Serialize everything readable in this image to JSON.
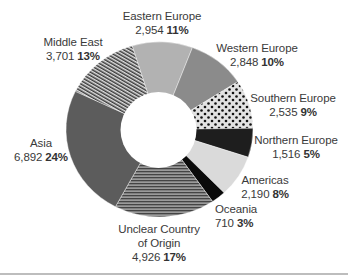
{
  "chart_data": {
    "type": "pie",
    "subtype": "donut",
    "title": "",
    "total": 28272,
    "start_angle_deg": -17,
    "direction": "clockwise",
    "slices": [
      {
        "label": "Eastern Europe",
        "value": 2954,
        "value_text": "2,954",
        "percent": "11%",
        "fill": "solid",
        "color": "#b2b2b2"
      },
      {
        "label": "Western Europe",
        "value": 2848,
        "value_text": "2,848",
        "percent": "10%",
        "fill": "solid",
        "color": "#8b8b8b"
      },
      {
        "label": "Southern Europe",
        "value": 2535,
        "value_text": "2,535",
        "percent": "9%",
        "fill": "dots",
        "color": "#dedede"
      },
      {
        "label": "Northern Europe",
        "value": 1516,
        "value_text": "1,516",
        "percent": "5%",
        "fill": "solid",
        "color": "#1e1e1e"
      },
      {
        "label": "Americas",
        "value": 2190,
        "value_text": "2,190",
        "percent": "8%",
        "fill": "solid",
        "color": "#dadada"
      },
      {
        "label": "Oceania",
        "value": 710,
        "value_text": "710",
        "percent": "3%",
        "fill": "solid",
        "color": "#0a0a0a"
      },
      {
        "label": "Unclear Country of Origin",
        "value": 4926,
        "value_text": "4,926",
        "percent": "17%",
        "fill": "horizontal-stripes",
        "color": "#7a7a7a"
      },
      {
        "label": "Asia",
        "value": 6892,
        "value_text": "6,892",
        "percent": "24%",
        "fill": "solid",
        "color": "#5c5c5c"
      },
      {
        "label": "Middle East",
        "value": 3701,
        "value_text": "3,701",
        "percent": "13%",
        "fill": "diagonal-stripes",
        "color": "#6a6a6a"
      }
    ],
    "legend": "none (direct labels)"
  },
  "labels": {
    "eastern": {
      "name": "Eastern Europe",
      "value": "2,954",
      "pct": "11%"
    },
    "western": {
      "name": "Western Europe",
      "value": "2,848",
      "pct": "10%"
    },
    "southern": {
      "name": "Southern Europe",
      "value": "2,535",
      "pct": "9%"
    },
    "northern": {
      "name": "Northern Europe",
      "value": "1,516",
      "pct": "5%"
    },
    "americas": {
      "name": "Americas",
      "value": "2,190",
      "pct": "8%"
    },
    "oceania": {
      "name": "Oceania",
      "value": "710",
      "pct": "3%"
    },
    "unclear": {
      "name1": "Unclear Country",
      "name2": "of Origin",
      "value": "4,926",
      "pct": "17%"
    },
    "asia": {
      "name": "Asia",
      "value": "6,892",
      "pct": "24%"
    },
    "middle_east": {
      "name": "Middle East",
      "value": "3,701",
      "pct": "13%"
    }
  }
}
